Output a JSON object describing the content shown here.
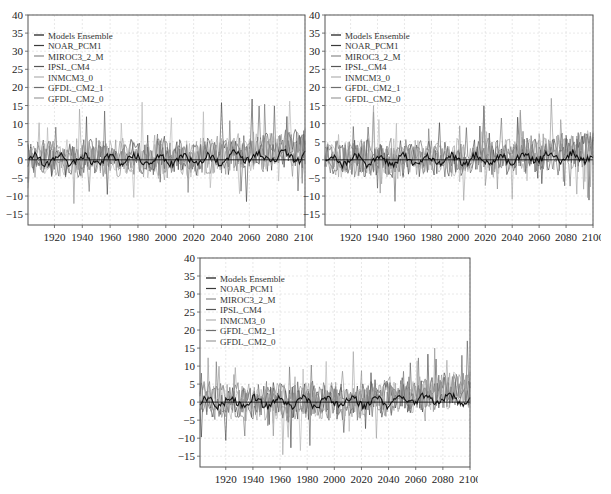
{
  "legend": [
    "Models Ensemble",
    "NOAR_PCM1",
    "MIROC3_2_M",
    "IPSL_CM4",
    "INMCM3_0",
    "GFDL_CM2_1",
    "GFDL_CM2_0"
  ],
  "colors": {
    "ensemble": "#111111",
    "models": [
      "#3a3a3a",
      "#8a8a8a",
      "#555555",
      "#b0b0b0",
      "#6e6e6e",
      "#9c9c9c"
    ],
    "grid": "#d8d8d8",
    "axis": "#555555",
    "zero": "#000000"
  },
  "axes": {
    "yticks": [
      "40",
      "35",
      "30",
      "25",
      "20",
      "15",
      "10",
      "5",
      "0",
      "-5",
      "-10",
      "-15"
    ],
    "xticks": [
      "1920",
      "1940",
      "1960",
      "1980",
      "2000",
      "2020",
      "2040",
      "2060",
      "2080",
      "2100"
    ]
  },
  "chart_data": [
    {
      "type": "line",
      "panel": "top-left",
      "title": "",
      "xlabel": "",
      "ylabel": "",
      "xlim": [
        1901,
        2100
      ],
      "ylim": [
        -18,
        40
      ],
      "grid": true,
      "legend_position": "upper left",
      "series_names": [
        "Models Ensemble",
        "NOAR_PCM1",
        "MIROC3_2_M",
        "IPSL_CM4",
        "INMCM3_0",
        "GFDL_CM2_1",
        "GFDL_CM2_0"
      ],
      "annotations": {
        "approx_range": [
          -15.5,
          17
        ],
        "ensemble_range": [
          -2,
          3
        ],
        "seed": 11
      }
    },
    {
      "type": "line",
      "panel": "top-right",
      "title": "",
      "xlabel": "",
      "ylabel": "",
      "xlim": [
        1901,
        2100
      ],
      "ylim": [
        -18,
        40
      ],
      "grid": true,
      "legend_position": "upper left",
      "series_names": [
        "Models Ensemble",
        "NOAR_PCM1",
        "MIROC3_2_M",
        "IPSL_CM4",
        "INMCM3_0",
        "GFDL_CM2_1",
        "GFDL_CM2_0"
      ],
      "annotations": {
        "approx_range": [
          -15.5,
          17
        ],
        "ensemble_range": [
          -2,
          3
        ],
        "seed": 23
      }
    },
    {
      "type": "line",
      "panel": "bottom",
      "title": "",
      "xlabel": "",
      "ylabel": "",
      "xlim": [
        1901,
        2100
      ],
      "ylim": [
        -18,
        40
      ],
      "grid": true,
      "legend_position": "upper left",
      "series_names": [
        "Models Ensemble",
        "NOAR_PCM1",
        "MIROC3_2_M",
        "IPSL_CM4",
        "INMCM3_0",
        "GFDL_CM2_1",
        "GFDL_CM2_0"
      ],
      "annotations": {
        "approx_range": [
          -15,
          15
        ],
        "ensemble_range": [
          -2,
          3
        ],
        "seed": 37
      }
    }
  ],
  "panels": [
    {
      "id": "top-left",
      "left": 28,
      "top": 15,
      "width": 277,
      "height": 210
    },
    {
      "id": "top-right",
      "left": 325,
      "top": 15,
      "width": 268,
      "height": 210
    },
    {
      "id": "bottom",
      "left": 200,
      "top": 258,
      "width": 270,
      "height": 209
    }
  ]
}
